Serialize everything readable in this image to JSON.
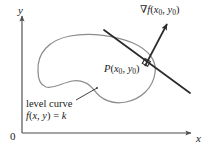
{
  "figure": {
    "background_color": "#ffffff"
  },
  "axes": {
    "y_label": "y",
    "x_label": "x",
    "origin_label": "0",
    "color": "#4d4d4d",
    "x_axis": {
      "x1": 22,
      "y1": 133,
      "x2": 195,
      "y2": 133
    },
    "y_axis": {
      "x1": 22,
      "y1": 133,
      "x2": 22,
      "y2": 12
    }
  },
  "annotations": {
    "gradient": {
      "nabla": "∇",
      "func": "f",
      "open": "(",
      "var1": "x",
      "sub1": "0",
      "comma": ", ",
      "var2": "y",
      "sub2": "0",
      "close": ")",
      "plain_text": "∇f(x0, y0)"
    },
    "point": {
      "name": "P",
      "open": "(",
      "var1": "x",
      "sub1": "0",
      "comma": ", ",
      "var2": "y",
      "sub2": "0",
      "close": ")",
      "plain_text": "P(x0, y0)"
    },
    "level_curve": {
      "line1": "level curve",
      "func": "f",
      "open": "(",
      "var1": "x",
      "comma": ", ",
      "var2": "y",
      "close": ")",
      "equals": " = ",
      "value": "k",
      "plain_text": "level curve  f(x, y) = k"
    }
  },
  "graphics": {
    "level_curve_color": "#8c8c8c",
    "tangent_line_color": "#2b2b2b",
    "gradient_vector_color": "#2b2b2b",
    "leader_line_color": "#2b2b2b",
    "right_angle_marker_color": "#2b2b2b",
    "level_curve_path": "M 38 72 C 38 50, 54 38, 76 36 C 98 34, 120 38, 134 44 C 148 50, 156 60, 155 72 C 154 86, 144 98, 128 102 C 114 106, 102 100, 96 92 C 90 84, 84 80, 74 82 C 64 84, 56 90, 48 88 C 40 86, 38 80, 38 72 Z",
    "tangent_line": {
      "x1": 104,
      "y1": 30,
      "x2": 190,
      "y2": 93
    },
    "gradient_vector": {
      "x1": 147,
      "y1": 64,
      "x2": 168,
      "y2": 23
    },
    "point_dot": {
      "cx": 147,
      "cy": 64
    },
    "leader_line": {
      "x1": 77,
      "y1": 100,
      "x2": 97,
      "y2": 89
    }
  }
}
